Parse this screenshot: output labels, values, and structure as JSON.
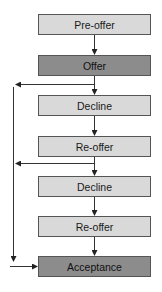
{
  "diagram": {
    "nodes": [
      {
        "id": "pre-offer",
        "label": "Pre-offer",
        "style": "light",
        "top": 14
      },
      {
        "id": "offer",
        "label": "Offer",
        "style": "dark",
        "top": 55
      },
      {
        "id": "decline-1",
        "label": "Decline",
        "style": "light",
        "top": 95
      },
      {
        "id": "re-offer-1",
        "label": "Re-offer",
        "style": "light",
        "top": 136
      },
      {
        "id": "decline-2",
        "label": "Decline",
        "style": "light",
        "top": 176
      },
      {
        "id": "re-offer-2",
        "label": "Re-offer",
        "style": "light",
        "top": 216
      },
      {
        "id": "acceptance",
        "label": "Acceptance",
        "style": "dark",
        "top": 256
      }
    ],
    "edges": [
      {
        "from": "pre-offer",
        "to": "offer"
      },
      {
        "from": "offer",
        "to": "decline-1"
      },
      {
        "from": "decline-1",
        "to": "re-offer-1"
      },
      {
        "from": "re-offer-1",
        "to": "decline-2"
      },
      {
        "from": "decline-2",
        "to": "re-offer-2"
      },
      {
        "from": "re-offer-2",
        "to": "acceptance"
      },
      {
        "from": "offer",
        "to": "acceptance",
        "via": "left-bypass"
      },
      {
        "from": "re-offer-1",
        "to": "acceptance",
        "via": "left-bypass"
      }
    ],
    "colors": {
      "light_fill": "#d9d9d9",
      "dark_fill": "#8c8c8c",
      "border": "#555555",
      "line": "#333333"
    }
  }
}
